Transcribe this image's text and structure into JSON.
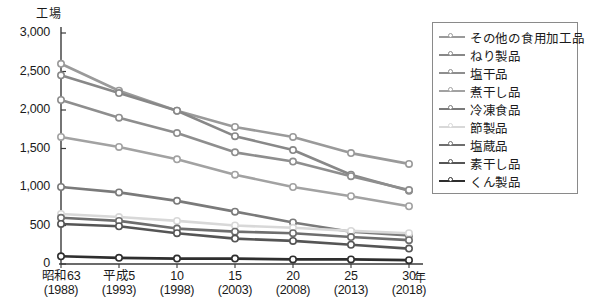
{
  "chart_data": {
    "type": "line",
    "title": "",
    "ylabel": "工場",
    "xlabel": "年",
    "ylim": [
      0,
      3000
    ],
    "yticks": [
      "0",
      "500",
      "1,000",
      "1,500",
      "2,000",
      "2,500",
      "3,000"
    ],
    "ytick_values": [
      0,
      500,
      1000,
      1500,
      2000,
      2500,
      3000
    ],
    "grid": false,
    "legend_position": "right",
    "x": [
      1988,
      1993,
      1998,
      2003,
      2008,
      2013,
      2018
    ],
    "categories": [
      "昭和63",
      "平成5",
      "10",
      "15",
      "20",
      "25",
      "30"
    ],
    "xtick_labels": [
      {
        "era": "昭和63",
        "year": "(1988)"
      },
      {
        "era": "平成5",
        "year": "(1993)"
      },
      {
        "era": "10",
        "year": "(1998)"
      },
      {
        "era": "15",
        "year": "(2003)"
      },
      {
        "era": "20",
        "year": "(2008)"
      },
      {
        "era": "25",
        "year": "(2013)"
      },
      {
        "era": "30",
        "year": "(2018)"
      }
    ],
    "series": [
      {
        "name": "その他の食用加工品",
        "color": "#9a9a9a",
        "values": [
          2600,
          2250,
          1990,
          1780,
          1650,
          1440,
          1300
        ]
      },
      {
        "name": "ねり製品",
        "color": "#888888",
        "values": [
          2450,
          2220,
          1990,
          1660,
          1480,
          1160,
          950
        ]
      },
      {
        "name": "塩干品",
        "color": "#8e8e8e",
        "values": [
          2130,
          1900,
          1700,
          1450,
          1330,
          1140,
          960
        ]
      },
      {
        "name": "煮干し品",
        "color": "#a2a2a2",
        "values": [
          1650,
          1520,
          1360,
          1160,
          1000,
          880,
          750
        ]
      },
      {
        "name": "冷凍食品",
        "color": "#7a7a7a",
        "values": [
          1000,
          930,
          820,
          680,
          540,
          420,
          370
        ]
      },
      {
        "name": "節製品",
        "color": "#d8d8d8",
        "values": [
          650,
          610,
          560,
          500,
          470,
          430,
          400
        ]
      },
      {
        "name": "塩蔵品",
        "color": "#6e6e6e",
        "values": [
          600,
          560,
          460,
          420,
          400,
          350,
          310
        ]
      },
      {
        "name": "素干し品",
        "color": "#555555",
        "values": [
          520,
          490,
          400,
          330,
          300,
          250,
          200
        ]
      },
      {
        "name": "くん製品",
        "color": "#2e2e2e",
        "values": [
          100,
          80,
          70,
          70,
          60,
          60,
          50
        ]
      }
    ]
  },
  "legend": {
    "items": [
      {
        "label": "その他の食用加工品"
      },
      {
        "label": "ねり製品"
      },
      {
        "label": "塩干品"
      },
      {
        "label": "煮干し品"
      },
      {
        "label": "冷凍食品"
      },
      {
        "label": "節製品"
      },
      {
        "label": "塩蔵品"
      },
      {
        "label": "素干し品"
      },
      {
        "label": "くん製品"
      }
    ]
  },
  "axes": {
    "y_title": "工場",
    "x_unit": "年"
  }
}
